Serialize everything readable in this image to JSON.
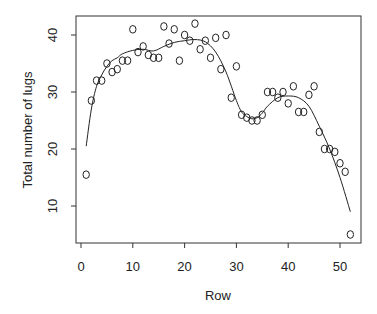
{
  "chart_data": {
    "type": "scatter",
    "title": "",
    "xlabel": "Row",
    "ylabel": "Total number of lugs",
    "xlim": [
      -1,
      54
    ],
    "ylim": [
      4,
      43.8
    ],
    "x_ticks": [
      0,
      10,
      20,
      30,
      40,
      50
    ],
    "y_ticks": [
      10,
      20,
      30,
      40
    ],
    "grid": false,
    "legend": null,
    "marker": "open-circle",
    "series": [
      {
        "name": "observed",
        "kind": "points",
        "x": [
          1,
          2,
          3,
          4,
          5,
          6,
          7,
          8,
          9,
          10,
          11,
          12,
          13,
          14,
          15,
          16,
          17,
          18,
          19,
          20,
          21,
          22,
          23,
          24,
          25,
          26,
          27,
          28,
          29,
          30,
          31,
          32,
          33,
          34,
          35,
          36,
          37,
          38,
          39,
          40,
          41,
          42,
          43,
          44,
          45,
          46,
          47,
          48,
          49,
          50,
          51,
          52
        ],
        "y": [
          15.5,
          28.5,
          32,
          32,
          35,
          33.5,
          34,
          35.5,
          35.5,
          41,
          37,
          38,
          36.5,
          36,
          36,
          41.5,
          38.5,
          41,
          35.5,
          40,
          39,
          42,
          37.5,
          39,
          36,
          39.5,
          34,
          40,
          29,
          34.5,
          26,
          25.5,
          25,
          25,
          26,
          30,
          30,
          29,
          30,
          28,
          31,
          26.5,
          26.5,
          29.5,
          31,
          23,
          20,
          20,
          19.5,
          17.5,
          16,
          5
        ]
      },
      {
        "name": "smooth fit",
        "kind": "line",
        "x": [
          1,
          2,
          3,
          4,
          5,
          6,
          7,
          8,
          10,
          12,
          14,
          16,
          18,
          20,
          22,
          24,
          26,
          28,
          30,
          31,
          32,
          33,
          34,
          35,
          36,
          38,
          40,
          42,
          44,
          46,
          48,
          50,
          52
        ],
        "y": [
          20.5,
          27,
          31,
          33,
          34.5,
          35.5,
          36,
          36.7,
          37.3,
          37.5,
          37.2,
          38,
          38.7,
          39,
          39.2,
          38.8,
          37,
          33.5,
          28.5,
          26.5,
          25.7,
          25.3,
          25.5,
          26.3,
          27.5,
          29,
          29.3,
          29,
          27.5,
          24,
          20,
          15,
          9
        ]
      }
    ]
  }
}
